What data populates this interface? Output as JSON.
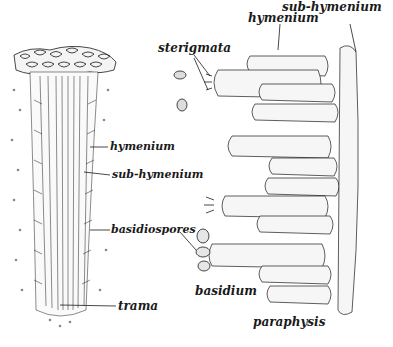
{
  "diagram": {
    "left_panel": {
      "description": "Cross section of a gill (lamella)",
      "labels": [
        {
          "id": "hymenium_left",
          "text": "hymenium"
        },
        {
          "id": "subhymenium_left",
          "text": "sub-hymenium"
        },
        {
          "id": "basidiospores",
          "text": "basidiospores"
        },
        {
          "id": "trama",
          "text": "trama"
        }
      ]
    },
    "right_panel": {
      "description": "Enlarged hymenium surface",
      "labels": [
        {
          "id": "sterigmata",
          "text": "sterigmata"
        },
        {
          "id": "hymenium_right",
          "text": "hymenium"
        },
        {
          "id": "subhymenium_right",
          "text": "sub-hymenium"
        },
        {
          "id": "basidium",
          "text": "basidium"
        },
        {
          "id": "paraphysis",
          "text": "paraphysis"
        }
      ]
    },
    "colors": {
      "ink": "#1a1a1a",
      "stipple": "#777777",
      "background": "#ffffff"
    }
  }
}
